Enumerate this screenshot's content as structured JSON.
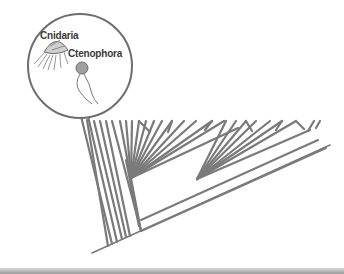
{
  "diagram": {
    "type": "phylogenetic-tree",
    "callout": {
      "labels": [
        "Cnidaria",
        "Ctenophora"
      ],
      "organisms": [
        "jellyfish",
        "comb-jelly"
      ]
    },
    "colors": {
      "branch": "#7a7a7a",
      "callout_border": "#6e6e6e",
      "label": "#3a3a3a",
      "bottom_bar": "#a0a0a0"
    }
  }
}
